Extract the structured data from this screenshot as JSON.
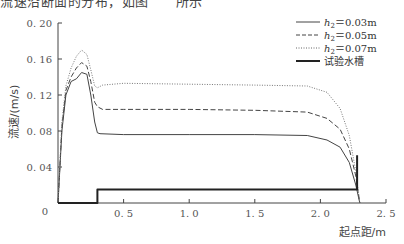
{
  "header": {
    "cut_text": "流速沿断面的分布，如图　　所示"
  },
  "chart_data": {
    "type": "line",
    "title": "",
    "xlabel": "起点距/m",
    "ylabel": "流速/(m/s)",
    "xlim": [
      0,
      2.5
    ],
    "ylim": [
      0,
      0.2
    ],
    "xticks": [
      "0",
      "0.5",
      "1.0",
      "1.5",
      "2.0",
      "2.5"
    ],
    "yticks": [
      "0",
      "0.04",
      "0.08",
      "0.12",
      "0.16",
      "0.20"
    ],
    "grid": false,
    "legend_position": "upper right",
    "series": [
      {
        "name": "h₂ = 0.03m",
        "style": "solid",
        "x": [
          0.0,
          0.03,
          0.06,
          0.1,
          0.14,
          0.18,
          0.22,
          0.25,
          0.28,
          0.3,
          0.32,
          0.5,
          1.0,
          1.5,
          1.9,
          2.05,
          2.15,
          2.22,
          2.27,
          2.3
        ],
        "values": [
          0.0,
          0.08,
          0.12,
          0.135,
          0.138,
          0.145,
          0.143,
          0.12,
          0.09,
          0.078,
          0.077,
          0.076,
          0.076,
          0.076,
          0.075,
          0.07,
          0.062,
          0.045,
          0.02,
          0.0
        ]
      },
      {
        "name": "h₂ = 0.05m",
        "style": "dashed",
        "x": [
          0.0,
          0.03,
          0.06,
          0.1,
          0.14,
          0.18,
          0.22,
          0.25,
          0.28,
          0.3,
          0.34,
          0.5,
          1.0,
          1.5,
          1.9,
          2.05,
          2.15,
          2.22,
          2.27,
          2.3
        ],
        "values": [
          0.0,
          0.085,
          0.125,
          0.14,
          0.15,
          0.156,
          0.152,
          0.135,
          0.112,
          0.107,
          0.104,
          0.104,
          0.104,
          0.103,
          0.101,
          0.094,
          0.082,
          0.06,
          0.03,
          0.0
        ]
      },
      {
        "name": "h₂ = 0.07m",
        "style": "dotted",
        "x": [
          0.0,
          0.03,
          0.06,
          0.1,
          0.14,
          0.18,
          0.22,
          0.25,
          0.28,
          0.3,
          0.34,
          0.5,
          1.0,
          1.5,
          1.9,
          2.05,
          2.15,
          2.22,
          2.27,
          2.3
        ],
        "values": [
          0.0,
          0.09,
          0.13,
          0.15,
          0.163,
          0.17,
          0.165,
          0.148,
          0.13,
          0.128,
          0.131,
          0.133,
          0.132,
          0.131,
          0.13,
          0.123,
          0.105,
          0.075,
          0.035,
          0.0
        ]
      },
      {
        "name": "试验水槽",
        "style": "thick-solid",
        "x": [
          0.0,
          0.3,
          0.3,
          2.28,
          2.28
        ],
        "values": [
          0.0,
          0.0,
          0.015,
          0.015,
          0.053
        ]
      }
    ],
    "legend": [
      "h₂ = 0.03m",
      "h₂ = 0.05m",
      "h₂ = 0.07m",
      "试验水槽"
    ]
  },
  "legend": {
    "items": [
      {
        "prefix": "h",
        "sub": "2",
        "text": "＝0.03m"
      },
      {
        "prefix": "h",
        "sub": "2",
        "text": "＝0.05m"
      },
      {
        "prefix": "h",
        "sub": "2",
        "text": "＝0.07m"
      },
      {
        "prefix": "",
        "sub": "",
        "text": "试验水槽"
      }
    ]
  },
  "axes": {
    "y_title": "流速/(m/s)",
    "x_title": "起点距/m",
    "y_ticks": [
      "0",
      "0. 04",
      "0. 08",
      "0. 12",
      "0. 16",
      "0. 20"
    ],
    "x_ticks": [
      "0",
      "0. 5",
      "1. 0",
      "1. 5",
      "2. 0",
      "2. 5"
    ]
  }
}
